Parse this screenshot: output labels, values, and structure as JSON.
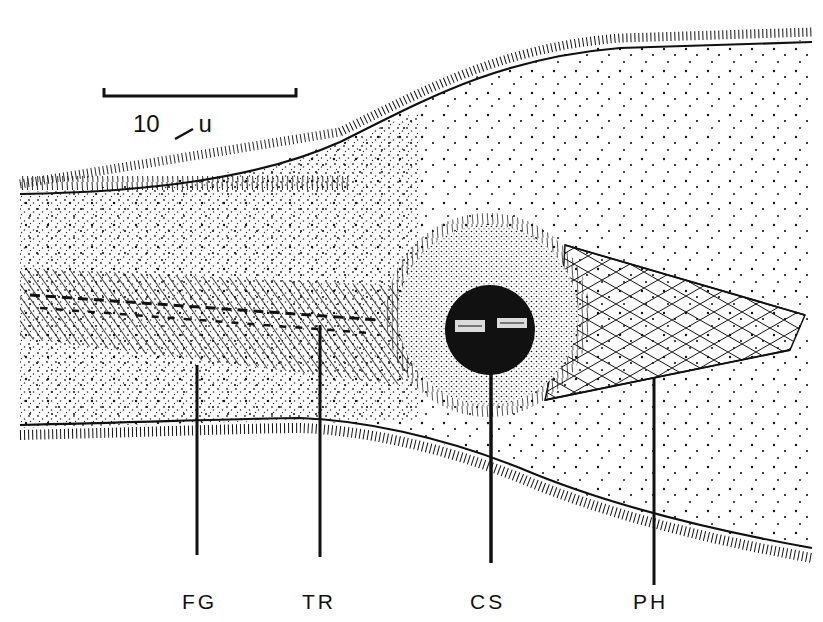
{
  "figure": {
    "type": "scientific-illustration",
    "scale_bar": {
      "value": "10",
      "unit": "u",
      "unit_glyph": "µ"
    },
    "labels": [
      {
        "id": "fg",
        "text": "FG",
        "x": 197
      },
      {
        "id": "tr",
        "text": "TR",
        "x": 320
      },
      {
        "id": "cs",
        "text": "CS",
        "x": 491
      },
      {
        "id": "ph",
        "text": "PH",
        "x": 654
      }
    ],
    "colors": {
      "ink": "#111111",
      "paper": "#ffffff"
    }
  }
}
